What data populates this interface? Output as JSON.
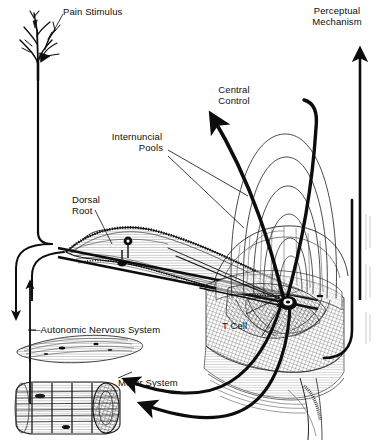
{
  "figure": {
    "background_color": "#ffffff",
    "ink_color": "#0d0d0d",
    "width": 380,
    "height": 443
  },
  "labels": {
    "pain_stimulus": "Pain Stimulus",
    "perceptual_mechanism_line1": "Perceptual",
    "perceptual_mechanism_line2": "Mechanism",
    "central_control_line1": "Central",
    "central_control_line2": "Control",
    "internuncial_pools_line1": "Internuncial",
    "internuncial_pools_line2": "Pools",
    "dorsal_root_line1": "Dorsal",
    "dorsal_root_line2": "Root",
    "t_cell": "T Cell",
    "autonomic_nervous_system": "—Autonomic Nervous System",
    "motor_system": "Motor System"
  },
  "structures": [
    {
      "name": "sensory-receptor-arborization",
      "description": "branching free nerve ending tree at top left"
    },
    {
      "name": "afferent-fiber",
      "description": "long vertical axon descending from receptor to dorsal root"
    },
    {
      "name": "dorsal-root-nerve",
      "description": "spindle shaped nerve trunk with two ganglion cell bodies"
    },
    {
      "name": "spinal-cord-segment",
      "description": "hatched dorsal horn and cord block at center right"
    },
    {
      "name": "internuncial-pool-arcs",
      "description": "nested thin loop arcs representing interneuron pools"
    },
    {
      "name": "t-cell-node",
      "description": "dark transmission cell node in dorsal horn"
    },
    {
      "name": "central-control-fiber",
      "description": "heavy curved arrow ascending to central control"
    },
    {
      "name": "perceptual-mechanism-arrow",
      "description": "long straight vertical arrow on far right"
    },
    {
      "name": "autonomic-effector",
      "description": "flat lens shaped smooth muscle / gland sheet"
    },
    {
      "name": "striated-muscle",
      "description": "cylindrical striated skeletal muscle at bottom left"
    }
  ]
}
